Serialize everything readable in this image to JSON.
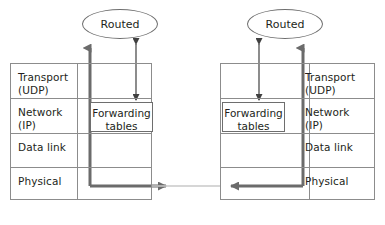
{
  "diagram": {
    "colors": {
      "thick_path": "#6b6b6b",
      "thin_arrow": "#404040",
      "box_border": "#8c8c8c",
      "text": "#231f20",
      "background": "#ffffff",
      "link_line": "#c9c9c9"
    },
    "nodes": {
      "left_router_label": "Routed",
      "right_router_label": "Routed",
      "left_forwarding_tables": "Forwarding\ntables",
      "right_forwarding_tables": "Forwarding\ntables"
    },
    "left_stack": {
      "layers": [
        {
          "label": "Transport\n(UDP)"
        },
        {
          "label": "Network\n(IP)"
        },
        {
          "label": "Data link"
        },
        {
          "label": "Physical"
        }
      ]
    },
    "right_stack": {
      "layers": [
        {
          "label": "Transport\n(UDP)"
        },
        {
          "label": "Network\n(IP)"
        },
        {
          "label": "Data link"
        },
        {
          "label": "Physical"
        }
      ]
    }
  }
}
